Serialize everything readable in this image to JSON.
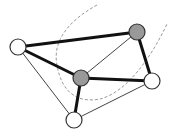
{
  "diagram": {
    "type": "graph",
    "nodes": [
      {
        "id": "left",
        "x": 18,
        "y": 47,
        "r": 8,
        "fill": "#ffffff"
      },
      {
        "id": "top_right",
        "x": 137,
        "y": 32,
        "r": 8,
        "fill": "#999999"
      },
      {
        "id": "middle",
        "x": 81,
        "y": 78,
        "r": 8,
        "fill": "#999999"
      },
      {
        "id": "right",
        "x": 152,
        "y": 81,
        "r": 8,
        "fill": "#ffffff"
      },
      {
        "id": "bottom",
        "x": 74,
        "y": 120,
        "r": 8,
        "fill": "#ffffff"
      }
    ],
    "edges": [
      {
        "from": "left",
        "to": "top_right",
        "weight": "thick"
      },
      {
        "from": "left",
        "to": "middle",
        "weight": "thick"
      },
      {
        "from": "left",
        "to": "bottom",
        "weight": "thin"
      },
      {
        "from": "top_right",
        "to": "middle",
        "weight": "thin"
      },
      {
        "from": "top_right",
        "to": "right",
        "weight": "thick"
      },
      {
        "from": "middle",
        "to": "right",
        "weight": "thick"
      },
      {
        "from": "middle",
        "to": "bottom",
        "weight": "thick"
      },
      {
        "from": "bottom",
        "to": "right",
        "weight": "thin"
      }
    ],
    "cut_curve": {
      "style": "dashed",
      "path": "M 97 5 C 70 20, 52 40, 57 65 C 62 95, 80 103, 100 99 C 125 93, 150 60, 167 24"
    },
    "colors": {
      "node_stroke": "#333333",
      "gray_node": "#999999",
      "white_node": "#ffffff",
      "thick_edge": "#111111",
      "thin_edge": "#444444",
      "dashed_curve": "#999999"
    }
  }
}
